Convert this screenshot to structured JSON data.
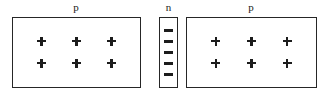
{
  "diagram": {
    "type": "pnp-junction-charge-diagram",
    "canvas": {
      "width": 331,
      "height": 98,
      "background": "#ffffff"
    },
    "line_color": "#262626",
    "carrier_color": "#1c1c1c",
    "regions": [
      {
        "id": "left-p-region",
        "label": "p",
        "carrier_symbol": "+",
        "carrier_rows": 2,
        "carrier_cols": 3,
        "carrier_count": 6,
        "box": {
          "x": 12,
          "y": 17,
          "width": 129,
          "height": 71
        },
        "label_pos": {
          "x": 76,
          "y": 3
        }
      },
      {
        "id": "middle-n-region",
        "label": "n",
        "carrier_symbol": "−",
        "carrier_rows": 5,
        "carrier_cols": 1,
        "carrier_count": 5,
        "box": {
          "x": 159,
          "y": 17,
          "width": 19,
          "height": 71
        },
        "label_pos": {
          "x": 168,
          "y": 3
        }
      },
      {
        "id": "right-p-region",
        "label": "p",
        "carrier_symbol": "+",
        "carrier_rows": 2,
        "carrier_cols": 3,
        "carrier_count": 6,
        "box": {
          "x": 186,
          "y": 17,
          "width": 131,
          "height": 71
        },
        "label_pos": {
          "x": 251,
          "y": 3
        }
      }
    ]
  }
}
